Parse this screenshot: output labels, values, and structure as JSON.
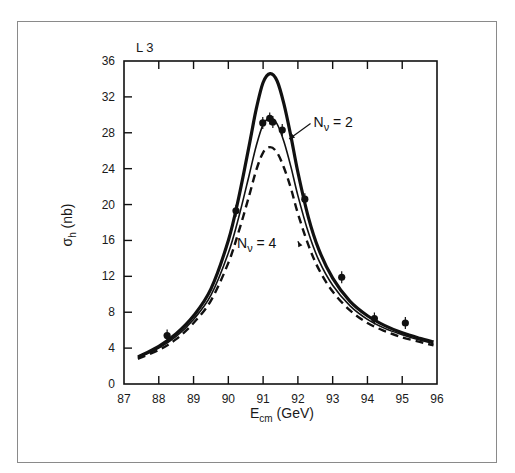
{
  "chart_data": {
    "type": "line",
    "title": "",
    "experiment_label": "L 3",
    "xlabel": "E",
    "xlabel_sub": "cm",
    "xlabel_unit": "(GeV)",
    "ylabel": "σ",
    "ylabel_sub": "h",
    "ylabel_unit": "(nb)",
    "xlim": [
      87,
      96
    ],
    "ylim": [
      0,
      36
    ],
    "x_ticks": [
      87,
      88,
      89,
      90,
      91,
      92,
      93,
      94,
      95,
      96
    ],
    "y_ticks": [
      0,
      4,
      8,
      12,
      16,
      20,
      24,
      28,
      32,
      36
    ],
    "grid": false,
    "legend": "none (inline annotations)",
    "series": [
      {
        "name": "N_ν = 2",
        "style": "thick-solid",
        "peak": {
          "x": 91.2,
          "y": 34.6
        },
        "x": [
          87.4,
          88.0,
          88.5,
          89.0,
          89.5,
          90.0,
          90.3,
          90.6,
          90.8,
          91.0,
          91.2,
          91.4,
          91.6,
          91.8,
          92.0,
          92.3,
          92.6,
          93.0,
          93.5,
          94.0,
          94.5,
          95.0,
          95.5,
          95.9
        ],
        "y": [
          3.0,
          4.2,
          5.6,
          7.6,
          10.6,
          16.0,
          20.8,
          26.6,
          30.6,
          33.6,
          34.6,
          33.8,
          31.2,
          27.6,
          23.6,
          18.6,
          15.0,
          11.8,
          9.2,
          7.6,
          6.5,
          5.7,
          5.1,
          4.7
        ]
      },
      {
        "name": "N_ν = 3",
        "style": "thin-solid",
        "peak": {
          "x": 91.2,
          "y": 29.6
        },
        "x": [
          87.4,
          88.0,
          88.5,
          89.0,
          89.5,
          90.0,
          90.3,
          90.6,
          90.8,
          91.0,
          91.2,
          91.4,
          91.6,
          91.8,
          92.0,
          92.3,
          92.6,
          93.0,
          93.5,
          94.0,
          94.5,
          95.0,
          95.5,
          95.9
        ],
        "y": [
          2.9,
          4.0,
          5.3,
          7.2,
          9.9,
          14.6,
          18.6,
          23.3,
          26.5,
          28.9,
          29.6,
          29.0,
          27.0,
          24.2,
          21.0,
          16.9,
          13.8,
          11.0,
          8.7,
          7.2,
          6.2,
          5.5,
          4.9,
          4.5
        ]
      },
      {
        "name": "N_ν = 4",
        "style": "dashed",
        "peak": {
          "x": 91.2,
          "y": 26.4
        },
        "x": [
          87.4,
          88.0,
          88.5,
          89.0,
          89.5,
          90.0,
          90.3,
          90.6,
          90.8,
          91.0,
          91.2,
          91.4,
          91.6,
          91.8,
          92.0,
          92.3,
          92.6,
          93.0,
          93.5,
          94.0,
          94.5,
          95.0,
          95.5,
          95.9
        ],
        "y": [
          2.8,
          3.8,
          5.0,
          6.8,
          9.3,
          13.5,
          17.0,
          21.0,
          23.8,
          25.8,
          26.4,
          25.8,
          24.1,
          21.8,
          19.0,
          15.5,
          12.8,
          10.3,
          8.2,
          6.8,
          5.9,
          5.2,
          4.7,
          4.3
        ]
      }
    ],
    "data_points": {
      "name": "L3 data",
      "x": [
        88.24,
        90.22,
        90.99,
        91.19,
        91.28,
        91.55,
        92.2,
        93.26,
        94.2,
        95.09
      ],
      "y": [
        5.4,
        19.3,
        29.1,
        29.6,
        29.2,
        28.3,
        20.6,
        11.9,
        7.3,
        6.8
      ]
    },
    "annotations": [
      {
        "text_main": "N",
        "text_sub": "ν",
        "text_rest": " = 2",
        "x": 92.45,
        "y": 28.6,
        "arrow_to": {
          "x": 91.75,
          "y": 27.3
        }
      },
      {
        "text_main": "N",
        "text_sub": "ν",
        "text_rest": " = 4",
        "x": 90.25,
        "y": 15.2,
        "arrow_to": {
          "x": 92.0,
          "y": 15.9
        }
      }
    ]
  }
}
